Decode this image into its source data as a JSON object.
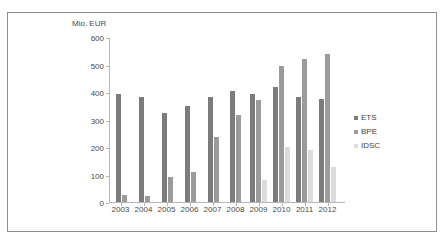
{
  "top_strip_text": ". . .",
  "chart_data": {
    "type": "bar",
    "title": "",
    "subtitle": "",
    "xlabel": "",
    "ylabel": "Mio. EUR",
    "ylim": [
      0,
      600
    ],
    "ytick_labels": [
      "600",
      "500",
      "400",
      "300",
      "200",
      "100",
      "0"
    ],
    "yticks": [
      600,
      500,
      400,
      300,
      200,
      100,
      0
    ],
    "grid": false,
    "legend_position": "right",
    "categories": [
      "2003",
      "2004",
      "2005",
      "2006",
      "2007",
      "2008",
      "2009",
      "2010",
      "2011",
      "2012"
    ],
    "series": [
      {
        "name": "ETS",
        "color": "#7c7c7c",
        "values": [
          395,
          385,
          325,
          350,
          385,
          405,
          397,
          420,
          383,
          377
        ]
      },
      {
        "name": "BPE",
        "color": "#9b9b9b",
        "values": [
          25,
          22,
          92,
          108,
          237,
          317,
          373,
          496,
          524,
          543
        ]
      },
      {
        "name": "IDSC",
        "color": "#dcdcdc",
        "values": [
          null,
          null,
          null,
          null,
          null,
          null,
          79,
          201,
          190,
          127
        ]
      }
    ]
  },
  "legend": {
    "items": [
      {
        "label": "ETS",
        "color": "#7c7c7c"
      },
      {
        "label": "BPE",
        "color": "#9b9b9b"
      },
      {
        "label": "IDSC",
        "color": "#dcdcdc"
      }
    ]
  }
}
